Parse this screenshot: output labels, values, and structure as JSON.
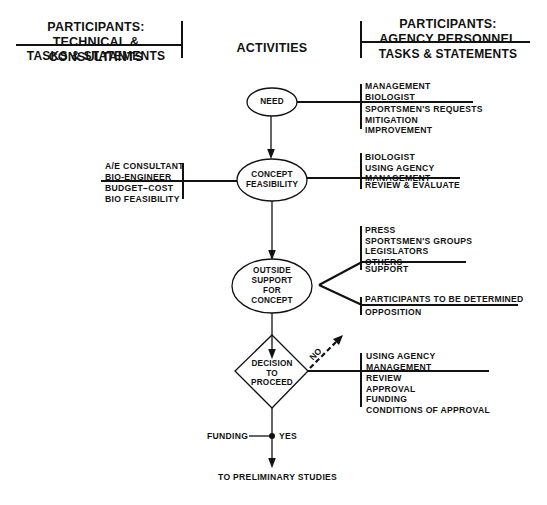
{
  "header": {
    "left": {
      "title_line1": "PARTICIPANTS:",
      "title_line2": "TECHNICAL & CONSULTANTS",
      "subtitle": "TASKS & STATEMENTS"
    },
    "center": {
      "title": "ACTIVITIES"
    },
    "right": {
      "title_line1": "PARTICIPANTS:",
      "title_line2": "AGENCY PERSONNEL",
      "subtitle": "TASKS & STATEMENTS"
    }
  },
  "nodes": {
    "need": {
      "label": "NEED"
    },
    "concept_feasibility": {
      "line1": "CONCEPT",
      "line2": "FEASIBILITY"
    },
    "outside_support": {
      "line1": "OUTSIDE",
      "line2": "SUPPORT",
      "line3": "FOR",
      "line4": "CONCEPT"
    },
    "decision": {
      "line1": "DECISION",
      "line2": "TO",
      "line3": "PROCEED"
    }
  },
  "need_agency": {
    "participants": [
      "MANAGEMENT",
      "BIOLOGIST"
    ],
    "tasks": [
      "SPORTSMEN'S REQUESTS",
      "MITIGATION",
      "IMPROVEMENT"
    ]
  },
  "feasibility_technical": {
    "participants": [
      "A/E CONSULTANT",
      "BIO-ENGINEER"
    ],
    "tasks": [
      "BUDGET–COST",
      "BIO FEASIBILITY"
    ]
  },
  "feasibility_agency": {
    "participants": [
      "BIOLOGIST",
      "USING AGENCY",
      "MANAGEMENT"
    ],
    "tasks": [
      "REVIEW & EVALUATE"
    ]
  },
  "support_agency": {
    "participants": [
      "PRESS",
      "SPORTSMEN'S GROUPS",
      "LEGISLATORS",
      "OTHERS"
    ],
    "tasks": [
      "SUPPORT"
    ]
  },
  "opposition_agency": {
    "participants": [
      "PARTICIPANTS TO BE DETERMINED"
    ],
    "tasks": [
      "OPPOSITION"
    ]
  },
  "decision_agency": {
    "participants": [
      "USING AGENCY",
      "MANAGEMENT"
    ],
    "tasks": [
      "REVIEW",
      "APPROVAL",
      "FUNDING",
      "CONDITIONS OF APPROVAL"
    ]
  },
  "decision_branches": {
    "no_label": "NO",
    "yes_label": "YES",
    "funding_label": "FUNDING"
  },
  "footer": {
    "next_step": "TO PRELIMINARY STUDIES"
  }
}
